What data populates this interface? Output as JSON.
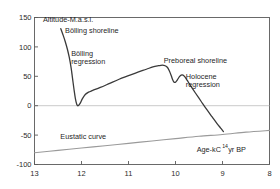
{
  "chart_data": {
    "type": "line",
    "title": "",
    "xlabel": "Age-kC14 yr BP",
    "xlabel_base": "Age-kC",
    "xlabel_sup": "14",
    "xlabel_tail": " yr BP",
    "ylabel": "Altitude-M.a.s.l.",
    "xlim": [
      13,
      8
    ],
    "ylim": [
      -100,
      150
    ],
    "x_ticks": [
      13,
      12,
      11,
      10,
      9,
      8
    ],
    "y_ticks": [
      150,
      100,
      50,
      0,
      -50,
      -100
    ],
    "x_tick_labels": [
      "13",
      "12",
      "11",
      "10",
      "9",
      "8"
    ],
    "y_tick_labels": [
      "150",
      "100",
      "50",
      "0",
      "-50",
      "-100"
    ],
    "grid": false,
    "zero_line": true,
    "legend": "none",
    "axis_direction": "x-reversed",
    "colors": {
      "shoreline_curve": "#3a3a3a",
      "eustatic_curve": "#9a9a9a",
      "frame": "#5a5a5a",
      "zero_line": "#bdbdbd",
      "text": "#1f1f1f"
    },
    "series": [
      {
        "name": "Relative shoreline displacement curve",
        "color": "#3a3a3a",
        "width": 1.3,
        "points": [
          [
            12.44,
            131
          ],
          [
            12.4,
            122
          ],
          [
            12.35,
            110
          ],
          [
            12.3,
            96
          ],
          [
            12.26,
            82
          ],
          [
            12.22,
            64
          ],
          [
            12.19,
            46
          ],
          [
            12.16,
            28
          ],
          [
            12.13,
            12
          ],
          [
            12.1,
            2
          ],
          [
            12.07,
            0
          ],
          [
            12.03,
            4
          ],
          [
            11.98,
            12
          ],
          [
            11.92,
            19
          ],
          [
            11.85,
            23
          ],
          [
            11.76,
            26
          ],
          [
            11.6,
            31
          ],
          [
            11.4,
            38
          ],
          [
            11.2,
            45
          ],
          [
            11.0,
            51
          ],
          [
            10.8,
            57
          ],
          [
            10.62,
            62
          ],
          [
            10.48,
            66
          ],
          [
            10.36,
            68
          ],
          [
            10.28,
            69
          ],
          [
            10.22,
            68
          ],
          [
            10.17,
            65
          ],
          [
            10.13,
            59
          ],
          [
            10.09,
            51
          ],
          [
            10.06,
            44
          ],
          [
            10.03,
            40
          ],
          [
            10.0,
            40
          ],
          [
            9.96,
            44
          ],
          [
            9.92,
            49
          ],
          [
            9.88,
            52
          ],
          [
            9.84,
            52
          ],
          [
            9.8,
            49
          ],
          [
            9.75,
            43
          ],
          [
            9.68,
            34
          ],
          [
            9.58,
            22
          ],
          [
            9.46,
            8
          ],
          [
            9.34,
            -6
          ],
          [
            9.22,
            -19
          ],
          [
            9.12,
            -30
          ],
          [
            9.04,
            -38
          ],
          [
            8.98,
            -44
          ]
        ]
      },
      {
        "name": "Eustatic curve",
        "color": "#9a9a9a",
        "width": 1.1,
        "points": [
          [
            13.0,
            -80
          ],
          [
            12.5,
            -76
          ],
          [
            12.0,
            -72
          ],
          [
            11.5,
            -68
          ],
          [
            11.0,
            -64
          ],
          [
            10.5,
            -60
          ],
          [
            10.0,
            -56
          ],
          [
            9.5,
            -52
          ],
          [
            9.0,
            -49
          ],
          [
            8.5,
            -45
          ],
          [
            8.0,
            -42
          ]
        ]
      }
    ],
    "annotations": [
      {
        "id": "y-axis-title",
        "text": "Altitude-M.a.s.l.",
        "x": 12.82,
        "y": 143,
        "anchor": "start"
      },
      {
        "id": "bolling-shoreline",
        "text": "Bölling shoreline",
        "x": 12.35,
        "y": 123,
        "anchor": "start"
      },
      {
        "id": "bolling-regression-line1",
        "text": "Bölling",
        "x": 12.22,
        "y": 84,
        "anchor": "start"
      },
      {
        "id": "bolling-regression-line2",
        "text": "regression",
        "x": 12.22,
        "y": 71,
        "anchor": "start"
      },
      {
        "id": "preboreal-shoreline",
        "text": "Preboreal shoreline",
        "x": 10.25,
        "y": 73,
        "anchor": "start"
      },
      {
        "id": "holocene-regression-line1",
        "text": "Holocene",
        "x": 9.78,
        "y": 45,
        "anchor": "start"
      },
      {
        "id": "holocene-regression-line2",
        "text": "regression",
        "x": 9.78,
        "y": 32,
        "anchor": "start"
      },
      {
        "id": "eustatic-curve-label",
        "text": "Eustatic curve",
        "x": 12.45,
        "y": -56,
        "anchor": "start"
      }
    ]
  }
}
